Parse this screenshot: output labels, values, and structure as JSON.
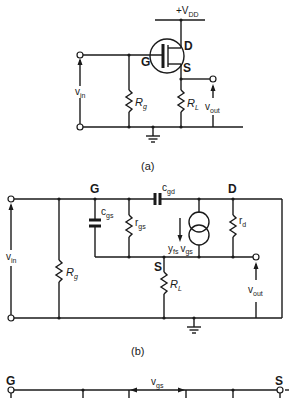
{
  "figure": {
    "a": {
      "caption": "(a)",
      "supply": {
        "sign": "+",
        "main": "V",
        "sub": "DD"
      },
      "nodes": {
        "gate": "G",
        "drain": "D",
        "source": "S"
      },
      "gate_resistor": {
        "main": "R",
        "sub": "g"
      },
      "load_resistor": {
        "main": "R",
        "sub": "L"
      },
      "input": {
        "main": "v",
        "sub": "in"
      },
      "output": {
        "main": "v",
        "sub": "out"
      }
    },
    "b": {
      "caption": "(b)",
      "nodes": {
        "gate": "G",
        "drain": "D",
        "source": "S"
      },
      "cgd": {
        "main": "c",
        "sub": "gd"
      },
      "cgs": {
        "main": "c",
        "sub": "gs"
      },
      "rgs": {
        "main": "r",
        "sub": "gs"
      },
      "rd": {
        "main": "r",
        "sub": "d"
      },
      "current_source": {
        "y": "y",
        "ysub": "fs",
        "v": "v",
        "vsub": "gs"
      },
      "gate_resistor": {
        "main": "R",
        "sub": "g"
      },
      "load_resistor": {
        "main": "R",
        "sub": "L"
      },
      "input": {
        "main": "v",
        "sub": "in"
      },
      "output": {
        "main": "v",
        "sub": "out"
      }
    },
    "c": {
      "nodes": {
        "gate": "G",
        "source": "S"
      },
      "vgs": {
        "main": "v",
        "sub": "gs"
      }
    }
  }
}
